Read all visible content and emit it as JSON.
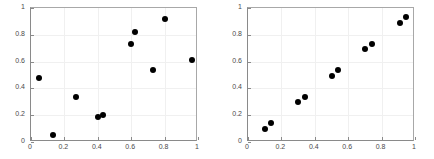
{
  "figure": {
    "background": "#ffffff",
    "marker_color": "#000000",
    "grid_color": "#f0f0f0",
    "axis_color": "#8a8a8a",
    "panel_count": 2
  },
  "chart_data": [
    {
      "type": "scatter",
      "title": "",
      "subtitle": "",
      "xlabel": "",
      "ylabel": "",
      "xlim": [
        0,
        1
      ],
      "ylim": [
        0,
        1
      ],
      "xticks": [
        0,
        0.2,
        0.4,
        0.6,
        0.8,
        1
      ],
      "xticklabels": [
        "0",
        "0.2",
        "0.4",
        "0.6",
        "0.8",
        "1"
      ],
      "yticks": [
        0,
        0.2,
        0.4,
        0.6,
        0.8,
        1
      ],
      "yticklabels": [
        "0",
        "0.2",
        "0.4",
        "0.6",
        "0.8",
        "1"
      ],
      "grid": true,
      "legend": null,
      "marker": "filled-circle",
      "points": [
        {
          "x": 0.05,
          "y": 0.48
        },
        {
          "x": 0.13,
          "y": 0.055
        },
        {
          "x": 0.27,
          "y": 0.335
        },
        {
          "x": 0.4,
          "y": 0.19
        },
        {
          "x": 0.43,
          "y": 0.205
        },
        {
          "x": 0.6,
          "y": 0.735
        },
        {
          "x": 0.62,
          "y": 0.82
        },
        {
          "x": 0.73,
          "y": 0.54
        },
        {
          "x": 0.805,
          "y": 0.92
        },
        {
          "x": 0.965,
          "y": 0.615
        }
      ]
    },
    {
      "type": "scatter",
      "title": "",
      "subtitle": "",
      "xlabel": "",
      "ylabel": "",
      "xlim": [
        0,
        1
      ],
      "ylim": [
        0,
        1
      ],
      "xticks": [
        0,
        0.2,
        0.4,
        0.6,
        0.8,
        1
      ],
      "xticklabels": [
        "0",
        "0.2",
        "0.4",
        "0.6",
        "0.8",
        "1"
      ],
      "yticks": [
        0,
        0.2,
        0.4,
        0.6,
        0.8,
        1
      ],
      "yticklabels": [
        "0",
        "0.2",
        "0.4",
        "0.6",
        "0.8",
        "1"
      ],
      "grid": true,
      "legend": null,
      "marker": "filled-circle",
      "points": [
        {
          "x": 0.1,
          "y": 0.1
        },
        {
          "x": 0.14,
          "y": 0.14
        },
        {
          "x": 0.3,
          "y": 0.3
        },
        {
          "x": 0.34,
          "y": 0.335
        },
        {
          "x": 0.5,
          "y": 0.495
        },
        {
          "x": 0.54,
          "y": 0.535
        },
        {
          "x": 0.7,
          "y": 0.695
        },
        {
          "x": 0.745,
          "y": 0.735
        },
        {
          "x": 0.91,
          "y": 0.89
        },
        {
          "x": 0.945,
          "y": 0.935
        }
      ]
    }
  ]
}
